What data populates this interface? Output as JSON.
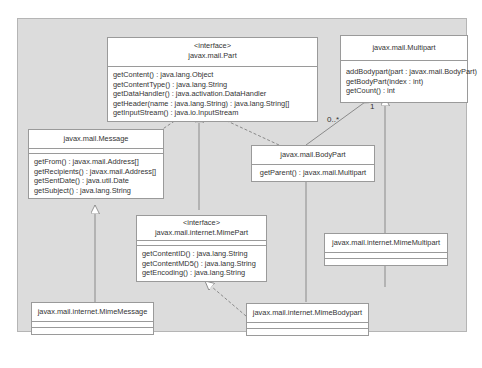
{
  "diagram": {
    "type": "UML class diagram",
    "classes": {
      "part": {
        "stereotype": "<interface>",
        "name": "javax.mail.Part",
        "operations": [
          "getContent() : java.lang.Object",
          "getContentType() : java.lang.String",
          "getDataHandler() : java.activation.DataHandler",
          "getHeader(name : java.lang.String) : java.lang.String[]",
          "getInputStream() : java.io.InputStream"
        ]
      },
      "multipart": {
        "name": "javax.mail.Multipart",
        "operations": [
          "addBodypart(part : javax.mail.BodyPart)",
          "getBodyPart(index : int)",
          "getCount() : int"
        ]
      },
      "message": {
        "name": "javax.mail.Message",
        "operations": [
          "getFrom() : javax.mail.Address[]",
          "getRecipients() : javax.mail.Address[]",
          "getSentDate() : java.util.Date",
          "getSubject() : java.lang.String"
        ]
      },
      "bodypart": {
        "name": "javax.mail.BodyPart",
        "operations": [
          "getParent() : javax.mail.Multipart"
        ]
      },
      "mimepart": {
        "stereotype": "<interface>",
        "name": "javax.mail.internet.MimePart",
        "operations": [
          "getContentID() : java.lang.String",
          "getContentMD5() : java.lang.String",
          "getEncoding() : java.lang.String"
        ]
      },
      "mimemultipart": {
        "name": "javax.mail.internet.MimeMultipart",
        "operations": []
      },
      "mimemessage": {
        "name": "javax.mail.internet.MimeMessage",
        "operations": []
      },
      "mimebodypart": {
        "name": "javax.mail.internet.MimeBodypart",
        "operations": []
      }
    },
    "multiplicities": {
      "bodypart_end": "0..*",
      "multipart_end": "1"
    }
  }
}
